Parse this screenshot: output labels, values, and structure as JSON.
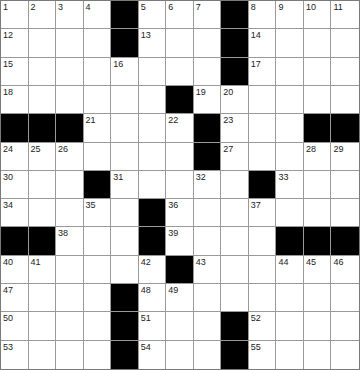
{
  "puzzle": {
    "rows": 13,
    "cols": 13,
    "colors": {
      "block": "#000000",
      "cell": "#ffffff",
      "gridline": "#9a9a9a"
    },
    "grid": [
      [
        "1",
        "2",
        "3",
        "4",
        "#",
        "5",
        "6",
        "7",
        "#",
        "8",
        "9",
        "10",
        "11"
      ],
      [
        "12",
        "",
        "",
        "",
        "#",
        "13",
        "",
        "",
        "#",
        "14",
        "",
        "",
        ""
      ],
      [
        "15",
        "",
        "",
        "",
        "16",
        "",
        "",
        "",
        "#",
        "17",
        "",
        "",
        ""
      ],
      [
        "18",
        "",
        "",
        "",
        "",
        "",
        "#",
        "19",
        "20",
        "",
        "",
        "",
        ""
      ],
      [
        "#",
        "#",
        "#",
        "21",
        "",
        "",
        "22",
        "#",
        "23",
        "",
        "",
        "#",
        "#"
      ],
      [
        "24",
        "25",
        "26",
        "",
        "",
        "",
        "",
        "#",
        "27",
        "",
        "",
        "28",
        "29"
      ],
      [
        "30",
        "",
        "",
        "#",
        "31",
        "",
        "",
        "32",
        "",
        "#",
        "33",
        "",
        ""
      ],
      [
        "34",
        "",
        "",
        "35",
        "",
        "#",
        "36",
        "",
        "",
        "37",
        "",
        "",
        ""
      ],
      [
        "#",
        "#",
        "38",
        "",
        "",
        "#",
        "39",
        "",
        "",
        "",
        "#",
        "#",
        "#"
      ],
      [
        "40",
        "41",
        "",
        "",
        "",
        "42",
        "#",
        "43",
        "",
        "",
        "44",
        "45",
        "46"
      ],
      [
        "47",
        "",
        "",
        "",
        "#",
        "48",
        "49",
        "",
        "",
        "",
        "",
        "",
        ""
      ],
      [
        "50",
        "",
        "",
        "",
        "#",
        "51",
        "",
        "",
        "#",
        "52",
        "",
        "",
        ""
      ],
      [
        "53",
        "",
        "",
        "",
        "#",
        "54",
        "",
        "",
        "#",
        "55",
        "",
        "",
        ""
      ]
    ]
  }
}
